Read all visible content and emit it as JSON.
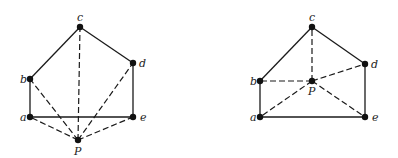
{
  "figures": [
    {
      "name": "left",
      "vertices": {
        "a": {
          "label": "a"
        },
        "b": {
          "label": "b"
        },
        "c": {
          "label": "c"
        },
        "d": {
          "label": "d"
        },
        "e": {
          "label": "e"
        },
        "P": {
          "label": "P"
        }
      },
      "edges": [
        [
          "a",
          "b"
        ],
        [
          "b",
          "c"
        ],
        [
          "c",
          "d"
        ],
        [
          "d",
          "e"
        ],
        [
          "a",
          "e"
        ]
      ],
      "dashed_edges": [
        [
          "P",
          "a"
        ],
        [
          "P",
          "b"
        ],
        [
          "P",
          "c"
        ],
        [
          "P",
          "d"
        ],
        [
          "P",
          "e"
        ]
      ]
    },
    {
      "name": "right",
      "vertices": {
        "a": {
          "label": "a"
        },
        "b": {
          "label": "b"
        },
        "c": {
          "label": "c"
        },
        "d": {
          "label": "d"
        },
        "e": {
          "label": "e"
        },
        "P": {
          "label": "P"
        }
      },
      "edges": [
        [
          "a",
          "b"
        ],
        [
          "b",
          "c"
        ],
        [
          "c",
          "d"
        ],
        [
          "d",
          "e"
        ],
        [
          "a",
          "e"
        ]
      ],
      "dashed_edges": [
        [
          "P",
          "a"
        ],
        [
          "P",
          "b"
        ],
        [
          "P",
          "c"
        ],
        [
          "P",
          "d"
        ],
        [
          "P",
          "e"
        ]
      ]
    }
  ]
}
